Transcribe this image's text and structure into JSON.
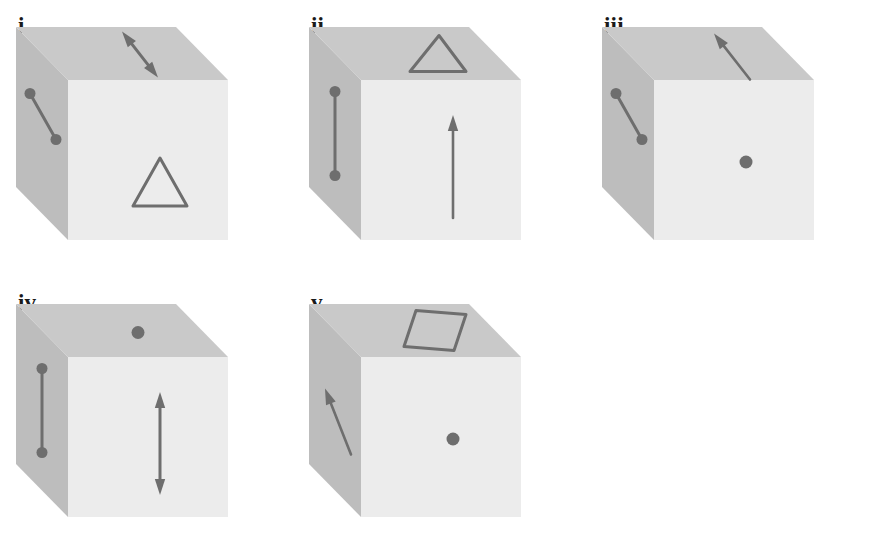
{
  "figure": {
    "title": "",
    "background_color": "#ffffff",
    "panel_count": 5,
    "layout": "two rows: three panels on top row, two panels on bottom row",
    "colors": {
      "front_face": "#ececec",
      "top_face": "#c9c9c9",
      "side_face": "#bdbdbd",
      "marking_stroke": "#6e6e6e",
      "label_text": "#1a1a1a",
      "background": "#ffffff"
    },
    "shared_description": "Each panel shows the same grey rectangular box (cuboid) drawn in oblique projection, with a visible light front face, a mid-grey top face and a darker left side face. Markings are drawn on the faces: dumbbell segments (line with a dot at each end), single dots, single-headed arrows, double-headed arrows, a triangle outline and a parallelogram (diamond) outline.",
    "panels": [
      {
        "id": "i",
        "label": "i.",
        "markings": [
          {
            "face": "side",
            "type": "dumbbell",
            "orientation": "diagonal down-right",
            "name": "dumbbell-segment"
          },
          {
            "face": "top",
            "type": "double-arrow",
            "orientation": "diagonal, pointing up-left and down-right",
            "name": "double-headed-arrow"
          },
          {
            "face": "front",
            "type": "triangle",
            "orientation": "upright outline",
            "name": "triangle-outline"
          }
        ]
      },
      {
        "id": "ii",
        "label": "ii.",
        "markings": [
          {
            "face": "side",
            "type": "dumbbell",
            "orientation": "vertical",
            "name": "dumbbell-segment"
          },
          {
            "face": "top",
            "type": "triangle",
            "orientation": "upright outline",
            "name": "triangle-outline"
          },
          {
            "face": "front",
            "type": "single-arrow",
            "orientation": "vertical, pointing up",
            "name": "single-headed-arrow"
          }
        ]
      },
      {
        "id": "iii",
        "label": "iii.",
        "markings": [
          {
            "face": "side",
            "type": "dumbbell",
            "orientation": "diagonal down-right",
            "name": "dumbbell-segment"
          },
          {
            "face": "top",
            "type": "single-arrow",
            "orientation": "diagonal, pointing up-left",
            "name": "single-headed-arrow"
          },
          {
            "face": "front",
            "type": "dot",
            "orientation": "centred",
            "name": "dot-marker"
          }
        ]
      },
      {
        "id": "iv",
        "label": "iv.",
        "markings": [
          {
            "face": "side",
            "type": "dumbbell",
            "orientation": "vertical",
            "name": "dumbbell-segment"
          },
          {
            "face": "top",
            "type": "dot",
            "orientation": "centred",
            "name": "dot-marker"
          },
          {
            "face": "front",
            "type": "double-arrow",
            "orientation": "vertical, pointing up and down",
            "name": "double-headed-arrow"
          }
        ]
      },
      {
        "id": "v",
        "label": "v.",
        "markings": [
          {
            "face": "side",
            "type": "single-arrow",
            "orientation": "diagonal, pointing up-left",
            "name": "single-headed-arrow"
          },
          {
            "face": "top",
            "type": "parallelogram",
            "orientation": "diamond outline",
            "name": "parallelogram-outline"
          },
          {
            "face": "front",
            "type": "dot",
            "orientation": "centred",
            "name": "dot-marker"
          }
        ]
      }
    ]
  }
}
